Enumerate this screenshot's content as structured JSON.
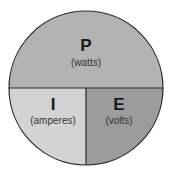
{
  "diagram": {
    "colors": {
      "top": "#b3b3b3",
      "bottom_left": "#d3d3d3",
      "bottom_right": "#9c9c9c",
      "outline": "#2a2a2a"
    },
    "sections": [
      {
        "symbol": "P",
        "unit": "(watts)"
      },
      {
        "symbol": "I",
        "unit": "(amperes)"
      },
      {
        "symbol": "E",
        "unit": "(volts)"
      }
    ]
  }
}
